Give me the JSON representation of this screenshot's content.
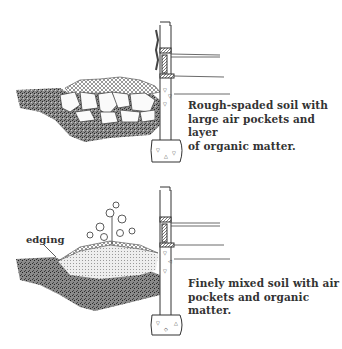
{
  "figure": {
    "panels": [
      {
        "id": "top",
        "caption_lines": [
          "Rough-spaded soil with",
          "large air pockets and layer",
          "of organic matter."
        ],
        "depicts": "rough-spaded soil bed with large clods and air pockets beside house foundation"
      },
      {
        "id": "bottom",
        "label": "edging",
        "caption_lines": [
          "Finely mixed soil with air",
          "pockets and organic matter."
        ],
        "depicts": "finely mixed soil bed with plant and edging beside house foundation"
      }
    ]
  },
  "colors": {
    "ink": "#333333",
    "background": "#ffffff",
    "soil_dark": "#6e6e6e",
    "fine_soil": "#e6e6e6"
  }
}
